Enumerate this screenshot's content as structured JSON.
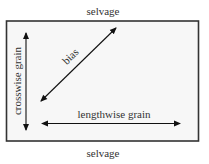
{
  "diagram": {
    "top_label": "selvage",
    "bottom_label": "selvage",
    "crosswise_label": "crosswise grain",
    "bias_label": "bias",
    "lengthwise_label": "lengthwise grain",
    "colors": {
      "fabric_fill": "#f7f7f7",
      "border": "#333333",
      "arrow": "#111111",
      "text": "#333333"
    }
  }
}
